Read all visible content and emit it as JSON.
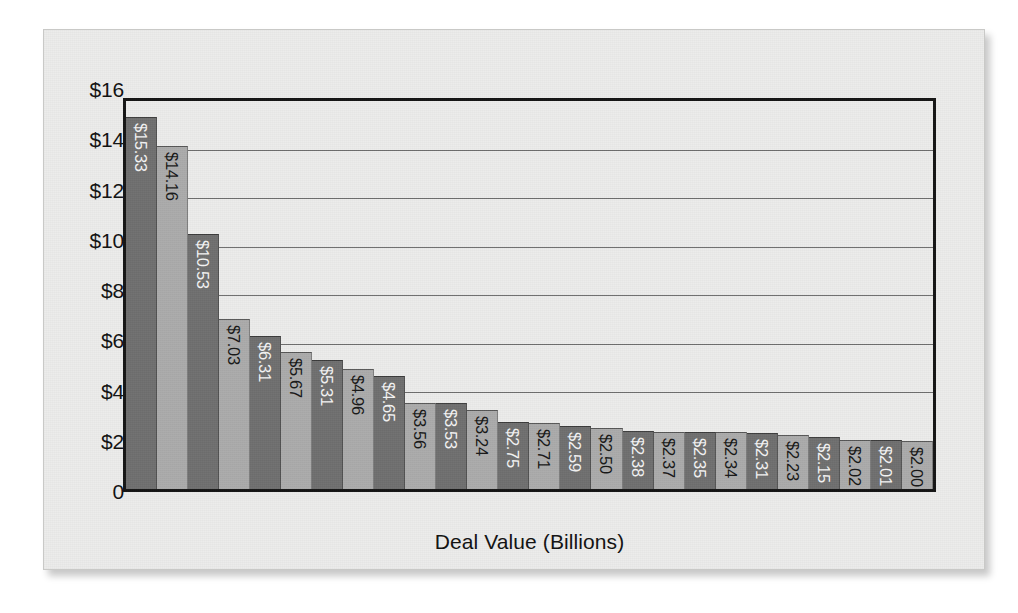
{
  "chart_data": {
    "type": "bar",
    "title": "",
    "subtitle": "",
    "xlabel": "Deal Value (Billions)",
    "ylabel": "",
    "ylim": [
      0,
      16
    ],
    "ytick_step": 2,
    "ytick_labels": [
      "$16",
      "$14",
      "$12",
      "$10",
      "$8",
      "$6",
      "$4",
      "$2",
      "0"
    ],
    "ytick_values": [
      16,
      14,
      12,
      10,
      8,
      6,
      4,
      2,
      0
    ],
    "grid": true,
    "grid_axis": "y",
    "legend": "none",
    "categories": [
      "1",
      "2",
      "3",
      "4",
      "5",
      "6",
      "7",
      "8",
      "9",
      "10",
      "11",
      "12",
      "13",
      "14",
      "15",
      "16",
      "17",
      "18",
      "19",
      "20",
      "21",
      "22",
      "23",
      "24",
      "25",
      "26"
    ],
    "values": [
      15.33,
      14.16,
      10.53,
      7.03,
      6.31,
      5.67,
      5.31,
      4.96,
      4.65,
      3.56,
      3.53,
      3.24,
      2.75,
      2.71,
      2.59,
      2.5,
      2.38,
      2.37,
      2.35,
      2.34,
      2.31,
      2.23,
      2.15,
      2.02,
      2.01,
      2.0
    ],
    "data_labels": [
      "$15.33",
      "$14.16",
      "$10.53",
      "$7.03",
      "$6.31",
      "$5.67",
      "$5.31",
      "$4.96",
      "$4.65",
      "$3.56",
      "$3.53",
      "$3.24",
      "$2.75",
      "$2.71",
      "$2.59",
      "$2.50",
      "$2.38",
      "$2.37",
      "$2.35",
      "$2.34",
      "$2.31",
      "$2.23",
      "$2.15",
      "$2.02",
      "$2.01",
      "$2.00"
    ],
    "bar_colors_alternating": [
      "#6f6f6f",
      "#ababab"
    ],
    "data_label_orientation": "vertical",
    "data_label_position": "inside-top"
  },
  "colors": {
    "bar_dark": "#6f6f6f",
    "bar_light": "#ababab",
    "plot_border": "#141414",
    "gridline": "#6e6e6e",
    "card_background": "#ececeb",
    "card_border": "#c9c9c7",
    "text": "#111111",
    "label_on_dark": "#f4f4f4",
    "label_on_light": "#171717"
  }
}
